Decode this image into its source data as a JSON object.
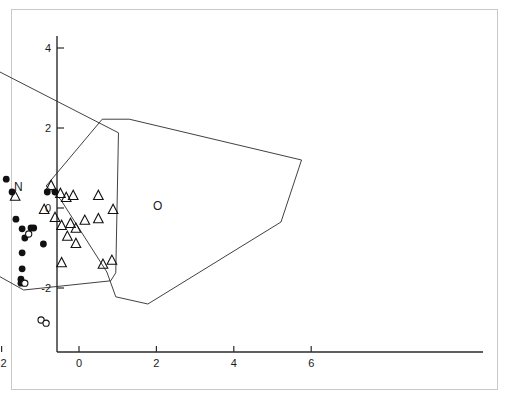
{
  "figure": {
    "width": 509,
    "height": 401,
    "background": "#ffffff",
    "frame_color": "#c9c9c9",
    "axis_color": "#2b2b2b"
  },
  "axes": {
    "x_ticks": [
      "-4",
      "-2",
      "0",
      "2",
      "4",
      "6"
    ],
    "x_tick_values": [
      -4,
      -2,
      0,
      2,
      4,
      6
    ],
    "y_ticks": [
      "4",
      "2",
      "0",
      "-2"
    ],
    "y_tick_values": [
      4,
      2,
      0,
      -2
    ],
    "x_origin_px": 79,
    "x_scale_px": 38.7,
    "y_origin_px": 208,
    "y_scale_px": 40,
    "x_axis_y_px": 352,
    "y_axis_x_px": 57,
    "x_axis_start_px": 57,
    "x_axis_end_px": 483,
    "y_axis_start_px": 36,
    "y_axis_end_px": 352
  },
  "group_labels": [
    {
      "text": "N",
      "x": -1.57,
      "y": 0.43,
      "name": "group-label-n"
    },
    {
      "text": "O",
      "x": 2.03,
      "y": -0.05,
      "name": "group-label-o"
    }
  ],
  "chart_data": {
    "type": "scatter",
    "title": "",
    "xlabel": "",
    "ylabel": "",
    "xlim": [
      -4.8,
      6.6
    ],
    "ylim": [
      -3.3,
      4.5
    ],
    "grid": false,
    "legend": "inline-labels",
    "series": [
      {
        "name": "N",
        "marker": "filled-circle",
        "color": "#111111",
        "label_text": "N",
        "points": [
          [
            -1.88,
            0.72
          ],
          [
            -2.28,
            0.4
          ],
          [
            -1.73,
            0.4
          ],
          [
            -0.82,
            0.4
          ],
          [
            -0.62,
            0.4
          ],
          [
            -1.63,
            -0.28
          ],
          [
            -1.47,
            -0.52
          ],
          [
            -1.24,
            -0.5
          ],
          [
            -1.17,
            -0.5
          ],
          [
            -1.4,
            -0.75
          ],
          [
            -0.92,
            -0.9
          ],
          [
            -1.47,
            -1.12
          ],
          [
            -1.47,
            -1.52
          ],
          [
            -1.5,
            -1.78
          ],
          [
            -1.5,
            -1.88
          ]
        ]
      },
      {
        "name": "O",
        "marker": "open-circle",
        "color": "#111111",
        "label_text": "O",
        "points": [
          [
            -4.18,
            -2.45
          ],
          [
            -2.73,
            -1.32
          ],
          [
            -2.62,
            -1.25
          ],
          [
            -2.43,
            -1.72
          ],
          [
            -2.3,
            -1.95
          ],
          [
            -2.45,
            -2.0
          ],
          [
            -2.52,
            -2.48
          ],
          [
            -2.68,
            -2.7
          ],
          [
            -2.22,
            -2.8
          ],
          [
            -1.3,
            -0.65
          ],
          [
            -1.4,
            -1.88
          ],
          [
            -0.98,
            -2.8
          ],
          [
            -0.85,
            -2.88
          ]
        ]
      },
      {
        "name": "triangles",
        "marker": "open-triangle",
        "color": "#111111",
        "label_text": "",
        "points": [
          [
            -0.72,
            0.55
          ],
          [
            -0.48,
            0.35
          ],
          [
            -0.33,
            0.25
          ],
          [
            -0.15,
            0.3
          ],
          [
            -1.65,
            0.28
          ],
          [
            -0.9,
            -0.05
          ],
          [
            -0.62,
            -0.25
          ],
          [
            -0.45,
            -0.45
          ],
          [
            -0.22,
            -0.4
          ],
          [
            -0.08,
            -0.52
          ],
          [
            0.15,
            -0.32
          ],
          [
            0.5,
            0.3
          ],
          [
            0.5,
            -0.28
          ],
          [
            0.88,
            -0.05
          ],
          [
            -0.3,
            -0.72
          ],
          [
            -0.08,
            -0.9
          ],
          [
            0.62,
            -1.42
          ],
          [
            -0.45,
            -1.38
          ],
          [
            0.85,
            -1.32
          ]
        ]
      }
    ],
    "hulls": [
      {
        "name": "hull-n",
        "vertices": [
          [
            -2.95,
            3.85
          ],
          [
            1.02,
            1.88
          ],
          [
            0.95,
            -1.62
          ],
          [
            0.82,
            -1.82
          ],
          [
            -1.43,
            -2.05
          ],
          [
            -2.72,
            -1.35
          ],
          [
            -3.05,
            -0.12
          ],
          [
            -3.05,
            3.35
          ]
        ]
      },
      {
        "name": "hull-o",
        "vertices": [
          [
            -0.85,
            0.55
          ],
          [
            0.6,
            2.22
          ],
          [
            1.3,
            2.22
          ],
          [
            5.75,
            1.2
          ],
          [
            5.22,
            -0.35
          ],
          [
            1.78,
            -2.4
          ],
          [
            0.95,
            -2.22
          ],
          [
            0.72,
            -1.6
          ],
          [
            -0.48,
            0.22
          ]
        ]
      }
    ]
  }
}
